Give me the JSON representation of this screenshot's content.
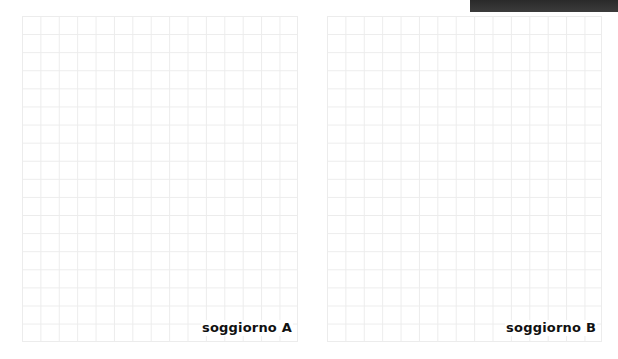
{
  "header": {
    "bar_color": "#333333"
  },
  "panels": [
    {
      "id": "A",
      "label": "soggiorno A",
      "columns": 15,
      "rows": 18,
      "grid_color": "#ececec"
    },
    {
      "id": "B",
      "label": "soggiorno B",
      "columns": 15,
      "rows": 18,
      "grid_color": "#ececec"
    }
  ]
}
